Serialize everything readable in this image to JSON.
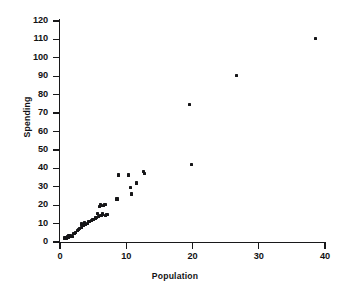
{
  "chart_data": {
    "type": "scatter",
    "title": "",
    "xlabel": "Population",
    "ylabel": "Spending",
    "xlim": [
      0,
      40
    ],
    "ylim": [
      0,
      120
    ],
    "xticks": [
      0,
      10,
      20,
      30,
      40
    ],
    "yticks": [
      0,
      10,
      20,
      30,
      40,
      50,
      60,
      70,
      80,
      90,
      100,
      110,
      120
    ],
    "xtick_labels": [
      "0",
      "10",
      "20",
      "30",
      "40"
    ],
    "ytick_labels": [
      "0",
      "10",
      "20",
      "30",
      "40",
      "50",
      "60",
      "70",
      "80",
      "90",
      "100",
      "110",
      "120"
    ],
    "grid": false,
    "legend": null,
    "marker": "square-dot",
    "marker_color": "#161618",
    "points": [
      {
        "x": 0.75,
        "y": 2.2
      },
      {
        "x": 0.9,
        "y": 2.0
      },
      {
        "x": 1.0,
        "y": 2.6
      },
      {
        "x": 1.1,
        "y": 3.0
      },
      {
        "x": 1.25,
        "y": 2.3
      },
      {
        "x": 1.35,
        "y": 3.3
      },
      {
        "x": 1.5,
        "y": 2.9
      },
      {
        "x": 1.6,
        "y": 3.6
      },
      {
        "x": 1.8,
        "y": 3.1
      },
      {
        "x": 2.0,
        "y": 4.4
      },
      {
        "x": 2.2,
        "y": 4.8
      },
      {
        "x": 2.4,
        "y": 5.3
      },
      {
        "x": 2.6,
        "y": 6.3
      },
      {
        "x": 2.8,
        "y": 6.6
      },
      {
        "x": 3.0,
        "y": 7.4
      },
      {
        "x": 3.2,
        "y": 8.0
      },
      {
        "x": 3.3,
        "y": 9.8
      },
      {
        "x": 3.5,
        "y": 9.2
      },
      {
        "x": 3.7,
        "y": 10.3
      },
      {
        "x": 3.9,
        "y": 9.6
      },
      {
        "x": 4.1,
        "y": 10.0
      },
      {
        "x": 4.3,
        "y": 11.1
      },
      {
        "x": 4.5,
        "y": 11.0
      },
      {
        "x": 4.7,
        "y": 11.6
      },
      {
        "x": 4.9,
        "y": 12.0
      },
      {
        "x": 5.1,
        "y": 12.4
      },
      {
        "x": 5.3,
        "y": 13.0
      },
      {
        "x": 5.5,
        "y": 13.4
      },
      {
        "x": 5.7,
        "y": 15.6
      },
      {
        "x": 5.8,
        "y": 14.0
      },
      {
        "x": 6.0,
        "y": 19.2
      },
      {
        "x": 6.1,
        "y": 20.1
      },
      {
        "x": 6.2,
        "y": 14.6
      },
      {
        "x": 6.4,
        "y": 15.2
      },
      {
        "x": 6.6,
        "y": 19.7
      },
      {
        "x": 6.8,
        "y": 20.2
      },
      {
        "x": 6.9,
        "y": 14.4
      },
      {
        "x": 7.1,
        "y": 15.0
      },
      {
        "x": 8.6,
        "y": 23.3
      },
      {
        "x": 8.8,
        "y": 36.4
      },
      {
        "x": 10.3,
        "y": 36.4
      },
      {
        "x": 10.7,
        "y": 29.8
      },
      {
        "x": 10.8,
        "y": 26.1
      },
      {
        "x": 11.6,
        "y": 32.0
      },
      {
        "x": 12.6,
        "y": 38.1
      },
      {
        "x": 12.7,
        "y": 37.4
      },
      {
        "x": 19.6,
        "y": 74.5
      },
      {
        "x": 19.8,
        "y": 41.9
      },
      {
        "x": 26.6,
        "y": 90.3
      },
      {
        "x": 38.6,
        "y": 110.3
      }
    ]
  }
}
